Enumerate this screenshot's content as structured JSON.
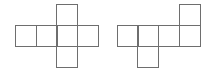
{
  "diagram": {
    "type": "cube-nets",
    "line_color": "#6e6e6e",
    "cell_size": 21,
    "nets": [
      {
        "name": "net-left",
        "description": "cross-shaped net: row of four squares with one above and one below the third square",
        "cells": [
          {
            "x": 15,
            "y": 25
          },
          {
            "x": 36,
            "y": 25
          },
          {
            "x": 56,
            "y": 25
          },
          {
            "x": 77,
            "y": 25
          },
          {
            "x": 56,
            "y": 4
          },
          {
            "x": 56,
            "y": 46
          }
        ]
      },
      {
        "name": "net-right",
        "description": "row of four squares with one above the fourth square and one below the second square",
        "cells": [
          {
            "x": 117,
            "y": 25
          },
          {
            "x": 137,
            "y": 25
          },
          {
            "x": 158,
            "y": 25
          },
          {
            "x": 179,
            "y": 25
          },
          {
            "x": 179,
            "y": 4
          },
          {
            "x": 137,
            "y": 46
          }
        ]
      }
    ]
  }
}
